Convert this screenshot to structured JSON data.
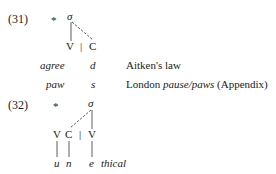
{
  "examples": [
    {
      "number": "(31)",
      "star": "*",
      "sigma": "σ",
      "skeleton": {
        "v": "V",
        "bar": "|",
        "c": "C"
      },
      "rows": [
        {
          "word": "agree",
          "segment": "d",
          "gloss": "Aitken's law"
        },
        {
          "word": "paw",
          "segment": "s",
          "gloss_prefix": "London ",
          "gloss_italic": "pause/paws",
          "gloss_suffix": " (Appendix)"
        }
      ]
    },
    {
      "number": "(32)",
      "star": "*",
      "sigma": "σ",
      "skeleton": {
        "v1": "V",
        "c": "C",
        "bar": "|",
        "v2": "V"
      },
      "segments": {
        "s1": "u",
        "s2": "n",
        "s3": "e",
        "rest": "thical"
      }
    }
  ]
}
